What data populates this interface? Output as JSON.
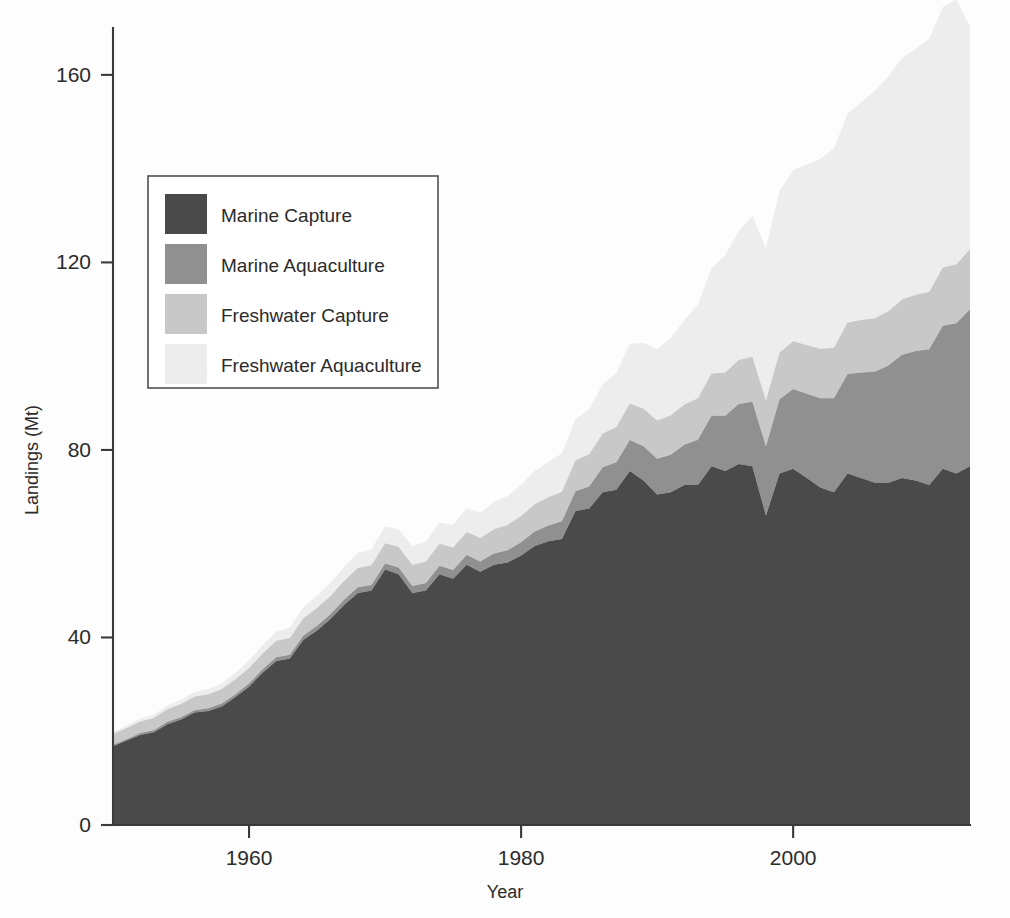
{
  "chart_data": {
    "type": "area",
    "stacked": true,
    "title": "",
    "xlabel": "Year",
    "ylabel": "Landings (Mt)",
    "xlim": [
      1950,
      2013
    ],
    "ylim": [
      0,
      170
    ],
    "xticks": [
      1960,
      1980,
      2000
    ],
    "xtick_labels": [
      "1960",
      "1980",
      "2000"
    ],
    "yticks": [
      0,
      40,
      80,
      120,
      160
    ],
    "ytick_labels": [
      "0",
      "40",
      "80",
      "120",
      "160"
    ],
    "grid": false,
    "legend_position": "upper-left",
    "colors": {
      "marine_capture": "#4a4a4a",
      "marine_aquaculture": "#909090",
      "freshwater_capture": "#c8c8c8",
      "freshwater_aquaculture": "#ededed",
      "axis": "#3a3a3a",
      "text": "#2b2b2b",
      "background": "#fdfdfd"
    },
    "x": [
      1950,
      1951,
      1952,
      1953,
      1954,
      1955,
      1956,
      1957,
      1958,
      1959,
      1960,
      1961,
      1962,
      1963,
      1964,
      1965,
      1966,
      1967,
      1968,
      1969,
      1970,
      1971,
      1972,
      1973,
      1974,
      1975,
      1976,
      1977,
      1978,
      1979,
      1980,
      1981,
      1982,
      1983,
      1984,
      1985,
      1986,
      1987,
      1988,
      1989,
      1990,
      1991,
      1992,
      1993,
      1994,
      1995,
      1996,
      1997,
      1998,
      1999,
      2000,
      2001,
      2002,
      2003,
      2004,
      2005,
      2006,
      2007,
      2008,
      2009,
      2010,
      2011,
      2012,
      2013
    ],
    "series": [
      {
        "name": "Marine Capture",
        "color": "#4a4a4a",
        "values": [
          16.8,
          18.0,
          19.2,
          19.8,
          21.5,
          22.5,
          24.0,
          24.3,
          25.3,
          27.3,
          29.5,
          32.5,
          35.0,
          35.5,
          39.5,
          41.5,
          44.0,
          47.0,
          49.5,
          50.0,
          54.5,
          53.5,
          49.5,
          50.0,
          53.5,
          52.5,
          55.5,
          54.0,
          55.5,
          56.0,
          57.5,
          59.5,
          60.5,
          61.0,
          67.0,
          67.5,
          71.0,
          71.5,
          75.5,
          73.5,
          70.5,
          71.0,
          72.5,
          72.5,
          76.5,
          75.5,
          77.0,
          76.5,
          66.0,
          75.0,
          76.0,
          74.0,
          72.0,
          71.0,
          75.0,
          74.0,
          73.0,
          73.0,
          74.0,
          73.5,
          72.5,
          76.0,
          75.0,
          76.5
        ]
      },
      {
        "name": "Marine Aquaculture",
        "color": "#909090",
        "values": [
          0.3,
          0.3,
          0.4,
          0.4,
          0.5,
          0.5,
          0.5,
          0.6,
          0.6,
          0.6,
          0.7,
          0.7,
          0.8,
          0.8,
          0.9,
          1.0,
          1.0,
          1.1,
          1.2,
          1.2,
          1.3,
          1.4,
          1.5,
          1.6,
          1.8,
          1.9,
          2.1,
          2.2,
          2.4,
          2.6,
          2.8,
          3.1,
          3.4,
          3.8,
          4.2,
          4.7,
          5.3,
          5.9,
          6.6,
          7.3,
          7.6,
          8.0,
          8.6,
          9.7,
          10.8,
          11.8,
          12.8,
          13.8,
          14.8,
          15.8,
          17.0,
          18.0,
          19.0,
          20.0,
          21.2,
          22.5,
          23.7,
          25.0,
          26.3,
          27.6,
          29.0,
          30.5,
          32.0,
          33.5
        ]
      },
      {
        "name": "Freshwater Capture",
        "color": "#c8c8c8",
        "values": [
          2.3,
          2.4,
          2.5,
          2.6,
          2.7,
          2.8,
          2.9,
          3.0,
          3.1,
          3.2,
          3.3,
          3.4,
          3.5,
          3.6,
          3.7,
          3.8,
          3.9,
          4.0,
          4.1,
          4.2,
          4.3,
          4.4,
          4.5,
          4.6,
          4.7,
          4.8,
          4.9,
          5.0,
          5.2,
          5.4,
          5.6,
          5.8,
          6.0,
          6.3,
          6.6,
          6.9,
          7.2,
          7.5,
          7.8,
          8.0,
          8.2,
          8.4,
          8.6,
          8.8,
          9.0,
          9.2,
          9.4,
          9.6,
          9.8,
          10.0,
          10.2,
          10.4,
          10.6,
          10.8,
          11.0,
          11.2,
          11.4,
          11.6,
          11.8,
          12.0,
          12.2,
          12.4,
          12.6,
          12.8
        ]
      },
      {
        "name": "Freshwater Aquaculture",
        "color": "#ededed",
        "values": [
          0.4,
          0.5,
          0.6,
          0.7,
          0.8,
          0.9,
          1.0,
          1.1,
          1.2,
          1.4,
          1.6,
          1.8,
          2.0,
          2.2,
          2.4,
          2.6,
          2.8,
          3.0,
          3.2,
          3.4,
          3.6,
          3.8,
          4.0,
          4.2,
          4.5,
          4.8,
          5.1,
          5.4,
          5.8,
          6.2,
          6.6,
          7.1,
          7.6,
          8.2,
          8.8,
          9.5,
          10.5,
          11.5,
          12.8,
          14.0,
          15.2,
          16.5,
          18.0,
          20.0,
          22.5,
          25.0,
          27.5,
          30.0,
          32.5,
          34.5,
          36.5,
          38.5,
          40.5,
          42.5,
          44.5,
          46.5,
          48.5,
          50.0,
          51.5,
          52.5,
          54.0,
          55.5,
          56.5,
          47.5
        ]
      }
    ]
  },
  "legend": {
    "items": [
      {
        "label": "Marine Capture",
        "color": "#4a4a4a"
      },
      {
        "label": "Marine Aquaculture",
        "color": "#909090"
      },
      {
        "label": "Freshwater Capture",
        "color": "#c8c8c8"
      },
      {
        "label": "Freshwater Aquaculture",
        "color": "#ededed"
      }
    ]
  },
  "axes": {
    "x_title": "Year",
    "y_title": "Landings (Mt)"
  }
}
